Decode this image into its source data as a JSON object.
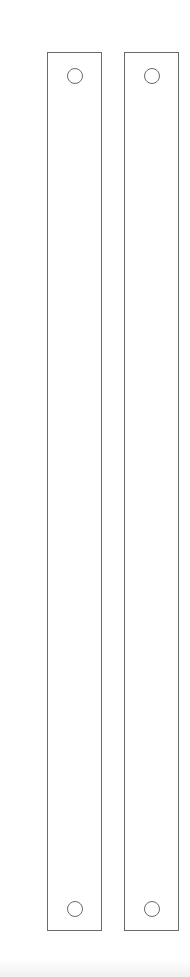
{
  "diagram": {
    "stroke_color": "#6a6a6a",
    "strips": [
      {
        "id": "left",
        "holes": [
          "top",
          "bottom"
        ]
      },
      {
        "id": "right",
        "holes": [
          "top",
          "bottom"
        ]
      }
    ]
  }
}
